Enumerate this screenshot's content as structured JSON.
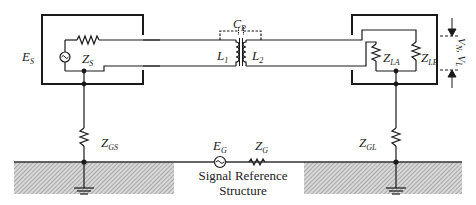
{
  "diagram": {
    "type": "circuit-schematic",
    "components": {
      "source": {
        "label": "E",
        "sub": "S"
      },
      "source_impedance": {
        "label": "Z",
        "sub": "S"
      },
      "transformer_primary": {
        "label": "L",
        "sub": "1"
      },
      "transformer_secondary": {
        "label": "L",
        "sub": "2"
      },
      "parasitic_cap": {
        "label": "C",
        "sub": "P"
      },
      "load_a": {
        "label": "Z",
        "sub": "LA"
      },
      "load_b": {
        "label": "Z",
        "sub": "LB"
      },
      "voltage_label": {
        "label": "V",
        "sub1": "N",
        "sep": ", ",
        "label2": "V",
        "sub2": "L"
      },
      "ground_source": {
        "label": "Z",
        "sub": "GS"
      },
      "ground_load": {
        "label": "Z",
        "sub": "GL"
      },
      "ground_source_emf": {
        "label": "E",
        "sub": "G"
      },
      "ground_impedance": {
        "label": "Z",
        "sub": "G"
      }
    },
    "caption": {
      "line1": "Signal Reference",
      "line2": "Structure"
    },
    "colors": {
      "line": "#1a1a1a",
      "hatch": "#9a9a9a",
      "background": "#ffffff"
    }
  }
}
